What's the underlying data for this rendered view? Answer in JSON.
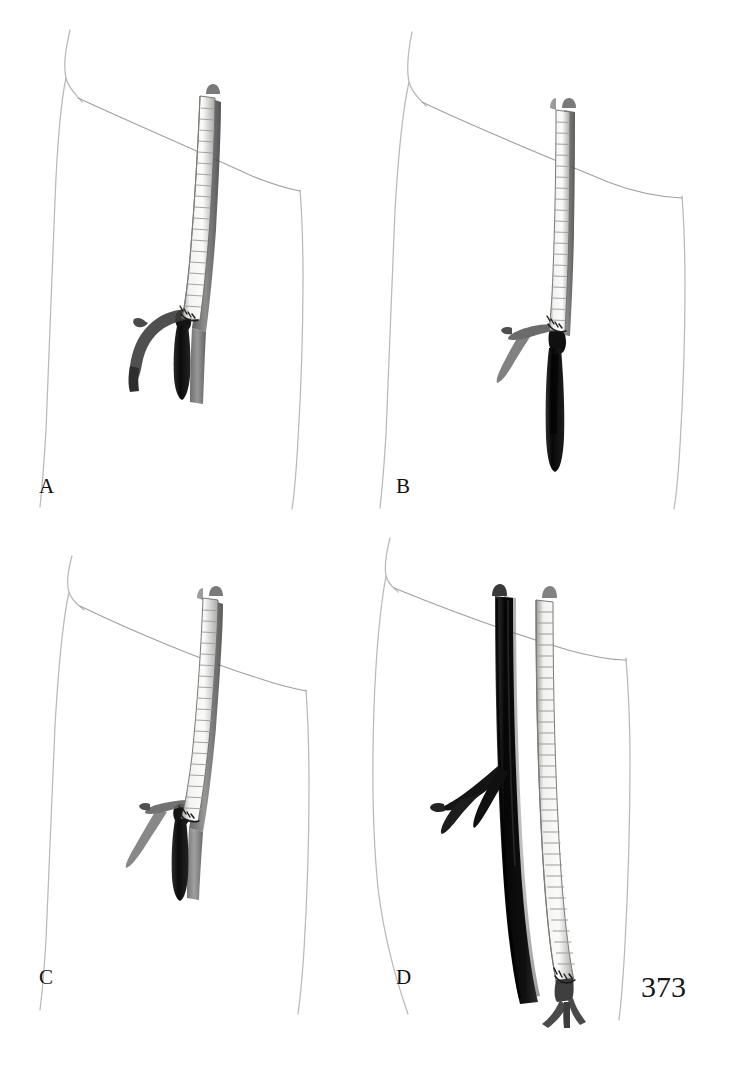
{
  "page": {
    "number": "373",
    "background_color": "#ffffff",
    "width": 729,
    "height": 1074,
    "figure_type": "medical-surgical-illustration",
    "layout": "2x2 panel grid"
  },
  "panels": [
    {
      "id": "A",
      "label": "A",
      "position": "top-left",
      "description": "Ringed prosthetic graft angled obliquely with short distal anastomosis and curved branch vessel, dark occluded arterial stump below"
    },
    {
      "id": "B",
      "label": "B",
      "position": "top-right",
      "description": "Ringed prosthetic graft running nearly vertical with long dark arterial segment extending distally"
    },
    {
      "id": "C",
      "label": "C",
      "position": "bottom-left",
      "description": "Ringed prosthetic graft angled obliquely with branch vessel crossing and short dark arterial stump"
    },
    {
      "id": "D",
      "label": "D",
      "position": "bottom-right",
      "description": "Long ringed prosthetic graft alongside large dark native artery with branching bifurcation and distal anastomosis"
    }
  ],
  "colors": {
    "body_outline": "#b8b8bc",
    "ligament_line": "#9a9a9f",
    "graft_ring_light": "#f4f4f2",
    "graft_ring_shadow": "#b9b9b6",
    "graft_outline": "#5a5a58",
    "vessel_mid_gray": "#6e6e6e",
    "vessel_dark": "#151515",
    "vessel_black": "#0a0a0a",
    "suture_dark": "#1d1d1d",
    "label_text": "#111111",
    "page_number_text": "#161616"
  },
  "anatomy_elements": {
    "hip_prominence": "anterior superior iliac spine contour",
    "inguinal_ligament": "oblique line from hip across groin",
    "thigh_medial_outline": "left vertical contour",
    "thigh_lateral_outline": "right vertical contour",
    "graft": "externally supported ringed PTFE bypass graft",
    "native_artery": "femoral artery shown dark",
    "branch_vessel": "profunda femoris branch"
  }
}
